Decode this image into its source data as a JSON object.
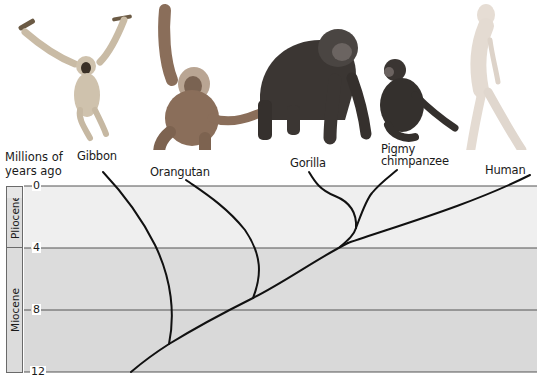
{
  "diagram": {
    "type": "phylogenetic-tree",
    "axis": {
      "title_line1": "Millions of",
      "title_line2": "years ago",
      "ticks": [
        "0",
        "4",
        "8",
        "12"
      ],
      "tick_values": [
        0,
        4,
        8,
        12
      ]
    },
    "epochs": [
      {
        "name": "Pliocene",
        "from_mya": 0,
        "to_mya": 4
      },
      {
        "name": "Miocene",
        "from_mya": 4,
        "to_mya": 12
      }
    ],
    "taxa": [
      {
        "label": "Gibbon",
        "divergence_mya": 11
      },
      {
        "label": "Orangutan",
        "divergence_mya": 7.5
      },
      {
        "label": "Gorilla",
        "divergence_mya": 2.7
      },
      {
        "label_line1": "Pigmy",
        "label_line2": "chimpanzee",
        "divergence_mya": 2.7
      },
      {
        "label": "Human",
        "divergence_mya": 3.6
      }
    ],
    "illustrations": [
      "gibbon-illustration",
      "orangutan-illustration",
      "gorilla-illustration",
      "chimpanzee-illustration",
      "human-illustration"
    ],
    "colors": {
      "band_light": "#efefef",
      "band_mid": "#dedede",
      "band_dark": "#d6d6d6",
      "lines": "#111111",
      "grid": "#555555"
    }
  }
}
